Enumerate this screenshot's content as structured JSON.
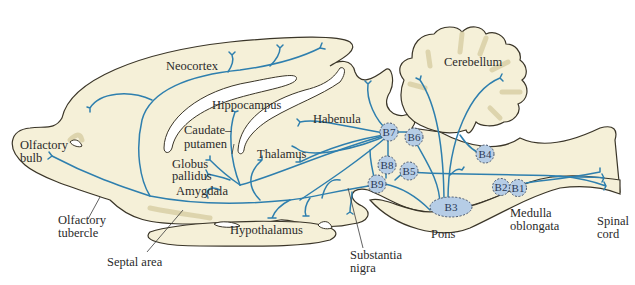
{
  "diagram": {
    "colors": {
      "tissue_fill": "#f5f0d8",
      "tissue_outline": "#3a3528",
      "fiber_blue": "#2e7fae",
      "nucleus_fill": "#b6cde6",
      "nucleus_outline": "#44546e"
    },
    "regions": [
      {
        "id": "neocortex",
        "label": "Neocortex"
      },
      {
        "id": "hippocampus",
        "label": "Hippocampus"
      },
      {
        "id": "caudate_putamen",
        "label_line1": "Caudate–",
        "label_line2": "putamen"
      },
      {
        "id": "habenula",
        "label": "Habenula"
      },
      {
        "id": "thalamus",
        "label": "Thalamus"
      },
      {
        "id": "globus_pallidus",
        "label_line1": "Globus",
        "label_line2": "pallidus"
      },
      {
        "id": "amygdala",
        "label": "Amygdala"
      },
      {
        "id": "olfactory_bulb",
        "label_line1": "Olfactory",
        "label_line2": "bulb"
      },
      {
        "id": "olfactory_tubercle",
        "label_line1": "Olfactory",
        "label_line2": "tubercle"
      },
      {
        "id": "septal_area",
        "label": "Septal area"
      },
      {
        "id": "hypothalamus",
        "label": "Hypothalamus"
      },
      {
        "id": "substantia_nigra",
        "label_line1": "Substantia",
        "label_line2": "nigra"
      },
      {
        "id": "pons",
        "label": "Pons"
      },
      {
        "id": "cerebellum",
        "label": "Cerebellum"
      },
      {
        "id": "medulla_oblongata",
        "label_line1": "Medulla",
        "label_line2": "oblongata"
      },
      {
        "id": "spinal_cord",
        "label_line1": "Spinal",
        "label_line2": "cord"
      }
    ],
    "nuclei": [
      {
        "id": "B1",
        "label": "B1"
      },
      {
        "id": "B2",
        "label": "B2"
      },
      {
        "id": "B3",
        "label": "B3"
      },
      {
        "id": "B4",
        "label": "B4"
      },
      {
        "id": "B5",
        "label": "B5"
      },
      {
        "id": "B6",
        "label": "B6"
      },
      {
        "id": "B7",
        "label": "B7"
      },
      {
        "id": "B8",
        "label": "B8"
      },
      {
        "id": "B9",
        "label": "B9"
      }
    ]
  }
}
